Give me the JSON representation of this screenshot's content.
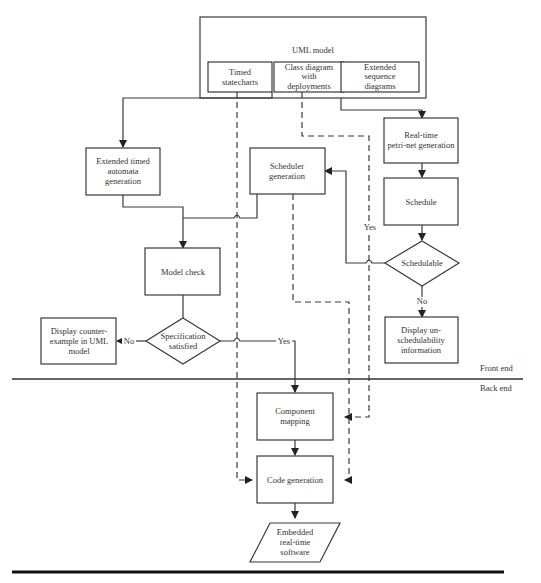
{
  "uml_model": {
    "title": "UML model",
    "sub_boxes": [
      {
        "lines": [
          "Timed",
          "statecharts"
        ]
      },
      {
        "lines": [
          "Class diagram",
          "with",
          "deployments"
        ]
      },
      {
        "lines": [
          "Extended",
          "sequence",
          "diagrams"
        ]
      }
    ]
  },
  "nodes": {
    "eta_gen": {
      "lines": [
        "Extended timed",
        "automata",
        "generation"
      ]
    },
    "scheduler_gen": {
      "lines": [
        "Scheduler",
        "generation"
      ]
    },
    "petri_gen": {
      "lines": [
        "Real-time",
        "petri-net generation"
      ]
    },
    "model_check": {
      "lines": [
        "Model check"
      ]
    },
    "schedule": {
      "lines": [
        "Schedule"
      ]
    },
    "schedulable": {
      "lines": [
        "Schedulable"
      ]
    },
    "spec_satisfied": {
      "lines": [
        "Specification",
        "satisfied"
      ]
    },
    "counter_example": {
      "lines": [
        "Display counter-",
        "example in UML",
        "model"
      ]
    },
    "unschedulability": {
      "lines": [
        "Display un-",
        "schedulability",
        "information"
      ]
    },
    "component_mapping": {
      "lines": [
        "Component",
        "mapping"
      ]
    },
    "code_gen": {
      "lines": [
        "Code generation"
      ]
    },
    "embedded_sw": {
      "lines": [
        "Embedded",
        "real-time",
        "software"
      ]
    }
  },
  "edge_labels": {
    "yes_schedulable": "Yes",
    "no_schedulable": "No",
    "no_spec": "No",
    "yes_spec": "Yes"
  },
  "regions": {
    "front_end": "Front end",
    "back_end": "Back end"
  }
}
